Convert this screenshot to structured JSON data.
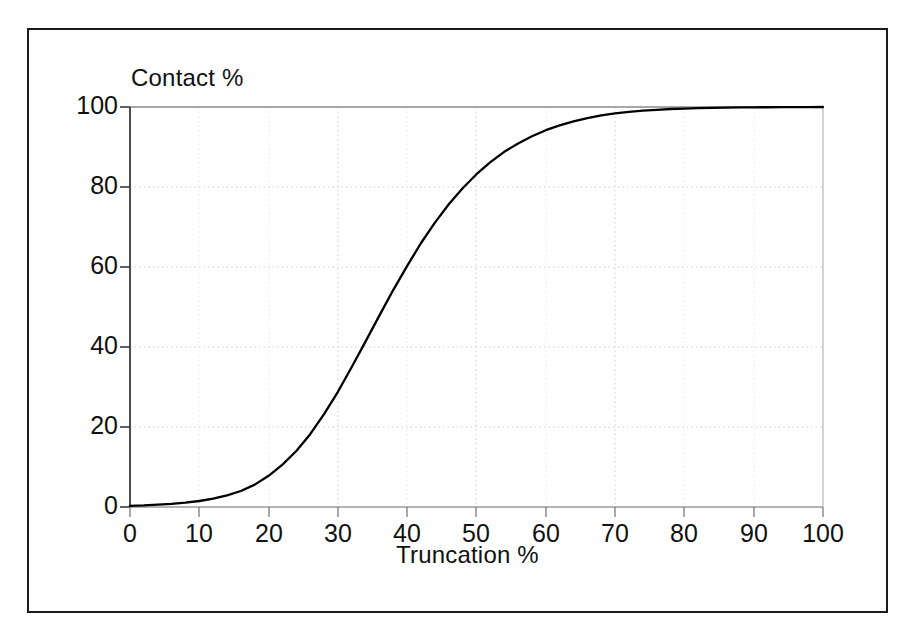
{
  "figure": {
    "border_color": "#1b1b1b",
    "background": "#ffffff"
  },
  "chart_data": {
    "type": "line",
    "title": "",
    "xlabel": "Truncation %",
    "ylabel": "Contact %",
    "xlim": [
      0,
      100
    ],
    "ylim": [
      0,
      100
    ],
    "grid": true,
    "grid_style": "dotted",
    "legend": "none",
    "line_color": "#000000",
    "xticks": [
      0,
      10,
      20,
      30,
      40,
      50,
      60,
      70,
      80,
      90,
      100
    ],
    "xtick_labels": [
      "0",
      "10",
      "20",
      "30",
      "40",
      "50",
      "60",
      "70",
      "80",
      "90",
      "100"
    ],
    "yticks": [
      0,
      20,
      40,
      60,
      80,
      100
    ],
    "ytick_labels": [
      "0",
      "20",
      "40",
      "60",
      "80",
      "100"
    ],
    "series": [
      {
        "name": "Contact %",
        "x": [
          0,
          2,
          4,
          6,
          8,
          10,
          12,
          14,
          16,
          18,
          20,
          22,
          24,
          26,
          28,
          30,
          32,
          34,
          36,
          38,
          40,
          42,
          44,
          46,
          48,
          50,
          52,
          54,
          56,
          58,
          60,
          62,
          64,
          66,
          68,
          70,
          72,
          74,
          76,
          78,
          80,
          82,
          84,
          86,
          88,
          90,
          92,
          94,
          96,
          98,
          100
        ],
        "values": [
          0.3,
          0.4,
          0.6,
          0.8,
          1.1,
          1.5,
          2.1,
          2.9,
          4.0,
          5.6,
          7.8,
          10.6,
          14.0,
          18.2,
          23.2,
          28.8,
          35.0,
          41.4,
          47.9,
          54.3,
          60.3,
          66.0,
          71.1,
          75.7,
          79.7,
          83.2,
          86.2,
          88.8,
          90.9,
          92.7,
          94.2,
          95.4,
          96.4,
          97.2,
          97.9,
          98.4,
          98.8,
          99.1,
          99.3,
          99.5,
          99.6,
          99.7,
          99.8,
          99.85,
          99.9,
          99.92,
          99.94,
          99.96,
          99.97,
          99.98,
          100
        ]
      }
    ],
    "annotations": []
  },
  "axes": {
    "y_title": "Contact %",
    "x_title": "Truncation %"
  },
  "y_tick_labels": [
    "100",
    "80",
    "60",
    "40",
    "20",
    "0"
  ],
  "x_tick_labels": [
    "0",
    "10",
    "20",
    "30",
    "40",
    "50",
    "60",
    "70",
    "80",
    "90",
    "100"
  ]
}
